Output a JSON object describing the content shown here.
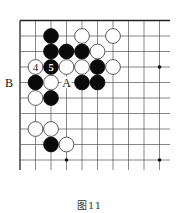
{
  "diagram": {
    "type": "go-board-fragment",
    "grid": {
      "cols_x": [
        20,
        35.5,
        51,
        66.5,
        82,
        97.5,
        113,
        128.5,
        144,
        159.5
      ],
      "rows_y": [
        20.5,
        36,
        51.5,
        67,
        82.5,
        98,
        113.5,
        129,
        144.5,
        160
      ],
      "extend_right_to": 170,
      "extend_bottom_to": 170,
      "edges": [
        "top",
        "left"
      ]
    },
    "star_points": [
      {
        "col": 9,
        "row": 3
      },
      {
        "col": 3,
        "row": 9
      },
      {
        "col": 9,
        "row": 9
      }
    ],
    "stones": [
      {
        "col": 2,
        "row": 1,
        "color": "black"
      },
      {
        "col": 4,
        "row": 1,
        "color": "white"
      },
      {
        "col": 6,
        "row": 1,
        "color": "white"
      },
      {
        "col": 2,
        "row": 2,
        "color": "black"
      },
      {
        "col": 3,
        "row": 2,
        "color": "black"
      },
      {
        "col": 4,
        "row": 2,
        "color": "black"
      },
      {
        "col": 5,
        "row": 2,
        "color": "white"
      },
      {
        "col": 1,
        "row": 3,
        "color": "white",
        "label": "4"
      },
      {
        "col": 2,
        "row": 3,
        "color": "black",
        "label": "5"
      },
      {
        "col": 3,
        "row": 3,
        "color": "white"
      },
      {
        "col": 4,
        "row": 3,
        "color": "white"
      },
      {
        "col": 5,
        "row": 3,
        "color": "black"
      },
      {
        "col": 6,
        "row": 3,
        "color": "white"
      },
      {
        "col": 1,
        "row": 4,
        "color": "black"
      },
      {
        "col": 2,
        "row": 4,
        "color": "white"
      },
      {
        "col": 4,
        "row": 4,
        "color": "black"
      },
      {
        "col": 5,
        "row": 4,
        "color": "black"
      },
      {
        "col": 1,
        "row": 5,
        "color": "white"
      },
      {
        "col": 2,
        "row": 5,
        "color": "black"
      },
      {
        "col": 1,
        "row": 7,
        "color": "white"
      },
      {
        "col": 2,
        "row": 7,
        "color": "white"
      },
      {
        "col": 2,
        "row": 8,
        "color": "black"
      },
      {
        "col": 3,
        "row": 8,
        "color": "white"
      }
    ],
    "point_labels": [
      {
        "text": "A",
        "col": 3,
        "row": 4
      },
      {
        "text": "B",
        "col": 0,
        "row": 4,
        "offset_x": -11
      }
    ],
    "colors": {
      "line": "#555555",
      "edge": "#222222",
      "black_stone": "#0a0a0a",
      "white_stone": "#ffffff",
      "stone_outline": "#333333"
    }
  },
  "caption": "图11"
}
